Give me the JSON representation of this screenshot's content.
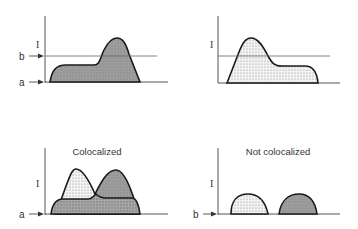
{
  "colors": {
    "axis": "#555555",
    "curve_stroke": "#1a1a1a",
    "gray_fill": "#9a9a9a",
    "dotted_fill_bg": "#f2f2f2",
    "dot": "#8a8a8a",
    "threshold_line": "#666666"
  },
  "panels": [
    {
      "id": "top-left",
      "title": "",
      "y_label": "I",
      "markers": [
        {
          "label": "b",
          "level": "threshold"
        },
        {
          "label": "a",
          "level": "baseline"
        }
      ],
      "curve": {
        "fill": "gray",
        "shape": "low plateau left, tall peak right"
      }
    },
    {
      "id": "top-right",
      "title": "",
      "y_label": "I",
      "markers": [],
      "curve": {
        "fill": "dotted",
        "shape": "tall peak left, low plateau right"
      }
    },
    {
      "id": "bottom-left",
      "title": "Colocalized",
      "y_label": "I",
      "markers": [
        {
          "label": "a",
          "level": "baseline"
        }
      ],
      "curves": [
        {
          "fill": "dotted",
          "shape": "peak left"
        },
        {
          "fill": "gray",
          "shape": "peak right"
        },
        {
          "fill": "overlap",
          "shape": "shared plateau"
        }
      ]
    },
    {
      "id": "bottom-right",
      "title": "Not colocalized",
      "y_label": "I",
      "markers": [
        {
          "label": "b",
          "level": "baseline"
        }
      ],
      "curves": [
        {
          "fill": "dotted",
          "shape": "separate hump left"
        },
        {
          "fill": "gray",
          "shape": "separate hump right"
        }
      ]
    }
  ]
}
